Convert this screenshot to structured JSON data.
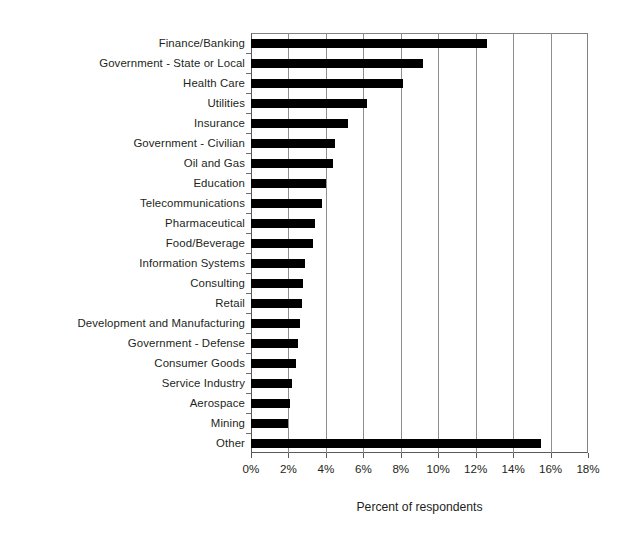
{
  "chart_data": {
    "type": "bar",
    "orientation": "horizontal",
    "title": "",
    "xlabel": "Percent of respondents",
    "ylabel": "",
    "xlim": [
      0,
      18
    ],
    "xticks": [
      "0%",
      "2%",
      "4%",
      "6%",
      "8%",
      "10%",
      "12%",
      "14%",
      "16%",
      "18%"
    ],
    "xtick_values": [
      0,
      2,
      4,
      6,
      8,
      10,
      12,
      14,
      16,
      18
    ],
    "grid": "vertical",
    "legend": "none",
    "bar_color": "#000000",
    "categories": [
      "Finance/Banking",
      "Government - State or Local",
      "Health Care",
      "Utilities",
      "Insurance",
      "Government - Civilian",
      "Oil and Gas",
      "Education",
      "Telecommunications",
      "Pharmaceutical",
      "Food/Beverage",
      "Information Systems",
      "Consulting",
      "Retail",
      "Development and Manufacturing",
      "Government - Defense",
      "Consumer Goods",
      "Service Industry",
      "Aerospace",
      "Mining",
      "Other"
    ],
    "values": [
      12.6,
      9.2,
      8.1,
      6.2,
      5.2,
      4.5,
      4.4,
      4.0,
      3.8,
      3.4,
      3.3,
      2.9,
      2.8,
      2.7,
      2.6,
      2.5,
      2.4,
      2.2,
      2.1,
      2.0,
      15.5
    ]
  }
}
